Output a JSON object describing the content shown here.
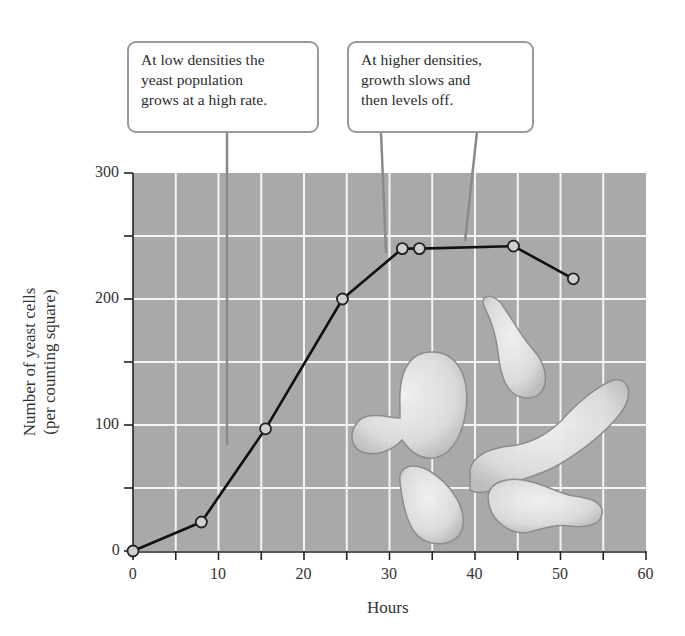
{
  "chart_data": {
    "type": "line",
    "title": "",
    "xlabel": "Hours",
    "ylabel": "Number of yeast cells (per counting square)",
    "ylabel_lines": [
      "Number of yeast cells",
      "(per counting square)"
    ],
    "xlim": [
      0,
      60
    ],
    "ylim": [
      0,
      300
    ],
    "x_ticks": [
      0,
      10,
      20,
      30,
      40,
      50,
      60
    ],
    "y_ticks": [
      0,
      100,
      200,
      300
    ],
    "grid": true,
    "grid_step_x": 5,
    "grid_step_y": 50,
    "series": [
      {
        "name": "Yeast population",
        "x": [
          0,
          8,
          15.5,
          24.5,
          31.5,
          33.5,
          44.5,
          51.5
        ],
        "values": [
          0,
          23,
          97,
          200,
          240,
          240,
          242,
          216
        ]
      }
    ],
    "annotations": [
      {
        "text": "At low densities the yeast population grows at a high rate.",
        "lines": [
          "At low densities the",
          "yeast population",
          "grows at a high rate."
        ]
      },
      {
        "text": "At higher densities, growth slows and then levels off.",
        "lines": [
          "At higher densities,",
          "growth slows and",
          "then levels off."
        ]
      }
    ],
    "background_illustration": "yeast cells"
  },
  "colors": {
    "plot_background": "#a9a9a9",
    "grid": "#f4f4f4",
    "line": "#111111",
    "marker_fill": "#d0d0d0",
    "callout_border": "#9a9a9a",
    "yeast_cell": "#e4e4e4"
  }
}
